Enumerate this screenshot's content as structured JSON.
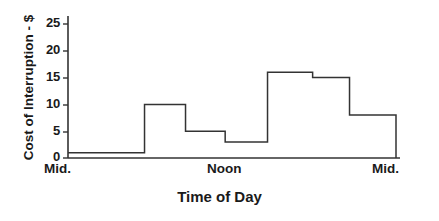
{
  "chart_data": {
    "type": "line",
    "subtype": "step",
    "title": "",
    "xlabel": "Time of Day",
    "ylabel": "Cost of Interruption - $",
    "xlim": [
      0,
      24
    ],
    "ylim": [
      0,
      25
    ],
    "grid": false,
    "legend": null,
    "y_ticks": [
      0,
      5,
      10,
      15,
      20,
      25
    ],
    "y_tick_labels": [
      "0",
      "5",
      "10",
      "15",
      "20",
      "25"
    ],
    "x_tick_labels": [
      "Mid.",
      "Noon",
      "Mid."
    ],
    "x_tick_positions": [
      0,
      12,
      24
    ],
    "line_color": "#333333",
    "axis_color": "#333333",
    "steps": [
      {
        "x_start": 0.0,
        "x_end": 5.6,
        "value": 1
      },
      {
        "x_start": 5.6,
        "x_end": 8.6,
        "value": 10
      },
      {
        "x_start": 8.6,
        "x_end": 11.5,
        "value": 5
      },
      {
        "x_start": 11.5,
        "x_end": 14.6,
        "value": 3
      },
      {
        "x_start": 14.6,
        "x_end": 17.9,
        "value": 16
      },
      {
        "x_start": 17.9,
        "x_end": 20.6,
        "value": 15
      },
      {
        "x_start": 20.6,
        "x_end": 24.0,
        "value": 8
      }
    ],
    "x": [
      0,
      5.6,
      5.6,
      8.6,
      8.6,
      11.5,
      11.5,
      14.6,
      14.6,
      17.9,
      17.9,
      20.6,
      20.6,
      24.0,
      24.0
    ],
    "values": [
      1,
      1,
      10,
      10,
      5,
      5,
      3,
      3,
      16,
      16,
      15,
      15,
      8,
      8,
      0
    ]
  },
  "axes": {
    "y_axis_label": "Cost of Interruption - $",
    "x_axis_label": "Time of Day",
    "y_tick_0": "0",
    "y_tick_1": "5",
    "y_tick_2": "10",
    "y_tick_3": "15",
    "y_tick_4": "20",
    "y_tick_5": "25",
    "x_tick_left": "Mid.",
    "x_tick_mid": "Noon",
    "x_tick_right": "Mid."
  }
}
